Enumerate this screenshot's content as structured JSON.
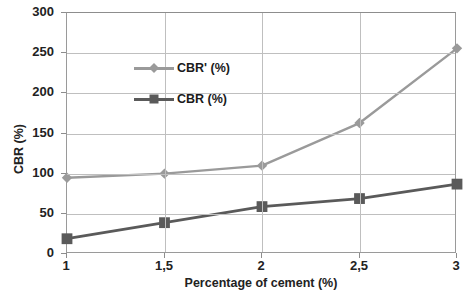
{
  "chart_data": {
    "type": "line",
    "title": "",
    "xlabel": "Percentage of cement (%)",
    "ylabel": "CBR (%)",
    "x": [
      1,
      1.5,
      2,
      2.5,
      3
    ],
    "categories": [
      "1",
      "1,5",
      "2",
      "2,5",
      "3"
    ],
    "xlim": [
      1,
      3
    ],
    "ylim": [
      0,
      300
    ],
    "yticks": [
      0,
      50,
      100,
      150,
      200,
      250,
      300
    ],
    "yticklabels": [
      "0",
      "50",
      "100",
      "150",
      "200",
      "250",
      "300"
    ],
    "grid": "horizontal",
    "legend_position": "upper-left-inside",
    "series": [
      {
        "name": "CBR' (%)",
        "values": [
          95,
          100,
          110,
          163,
          256
        ],
        "color": "#9a9a9a",
        "marker": "diamond"
      },
      {
        "name": "CBR (%)",
        "values": [
          19,
          39,
          59,
          69,
          87
        ],
        "color": "#5a5a5a",
        "marker": "square"
      }
    ]
  },
  "axes": {
    "y_title": "CBR (%)",
    "x_title": "Percentage of cement (%)"
  },
  "legend": {
    "items": [
      {
        "label": "CBR' (%)"
      },
      {
        "label": "CBR (%)"
      }
    ]
  },
  "colors": {
    "series_1": "#9a9a9a",
    "series_2": "#5a5a5a",
    "grid": "#bfbfbf",
    "axis": "#8d8d8d",
    "text": "#222222",
    "background": "#ffffff"
  }
}
